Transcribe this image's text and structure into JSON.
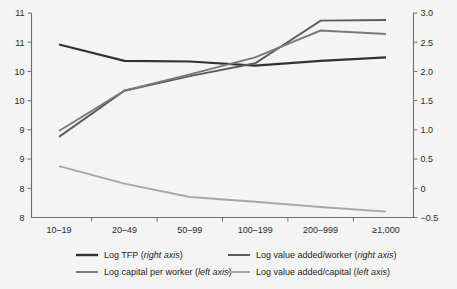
{
  "chart_data": {
    "type": "line",
    "title": "",
    "subtitle": "",
    "xlabel": "",
    "ylabel": "",
    "grid": false,
    "legend_position": "bottom",
    "categories": [
      "10–19",
      "20–49",
      "50–99",
      "100–199",
      "200–999",
      "≥1,000"
    ],
    "left_axis": {
      "label": "",
      "ticks": [
        "11",
        "11",
        "10",
        "10",
        "9",
        "9",
        "8"
      ],
      "tick_values": [
        11.5,
        11,
        10.5,
        10,
        9.5,
        9,
        8.5
      ],
      "ylim": [
        8,
        11.5
      ],
      "note": "axis continues to 8 at the baseline"
    },
    "right_axis": {
      "label": "",
      "ticks": [
        "3.0",
        "2.5",
        "2.0",
        "1.5",
        "1.0",
        "0.5",
        "0",
        "−0.5"
      ],
      "tick_values": [
        3.0,
        2.5,
        2.0,
        1.5,
        1.0,
        0.5,
        0.0,
        -0.5
      ],
      "ylim": [
        -0.5,
        3.0
      ]
    },
    "series": [
      {
        "name": "Log TFP (right axis)",
        "label_main": "Log TFP",
        "label_axis": "right axis",
        "axis": "right",
        "color": "#313131",
        "width": 2.2,
        "values": [
          2.46,
          2.18,
          2.17,
          2.1,
          2.18,
          2.24
        ]
      },
      {
        "name": "Log value added/worker (right axis)",
        "label_main": "Log value added/worker",
        "label_axis": "right axis",
        "axis": "right",
        "color": "#5d5d5d",
        "width": 1.9,
        "values": [
          0.88,
          1.67,
          1.92,
          2.14,
          2.87,
          2.88
        ]
      },
      {
        "name": "Log capital per worker (left axis)",
        "label_main": "Log capital per worker",
        "label_axis": "left axis",
        "axis": "left",
        "color": "#7a7a7a",
        "width": 1.9,
        "values": [
          9.48,
          10.17,
          10.45,
          10.74,
          11.2,
          11.14
        ]
      },
      {
        "name": "Log value added/capital (left axis)",
        "label_main": "Log value added/capital",
        "label_axis": "left axis",
        "axis": "left",
        "color": "#a8a8a8",
        "width": 1.9,
        "values": [
          8.88,
          8.58,
          8.35,
          8.27,
          8.18,
          8.1
        ]
      }
    ],
    "colors": {
      "background": "#f4f4f4",
      "axis": "#6f6f6f",
      "text": "#2b2b2b"
    }
  }
}
